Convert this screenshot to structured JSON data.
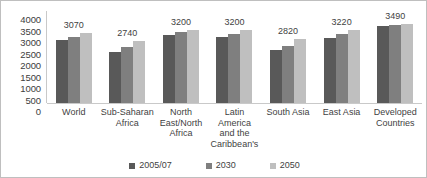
{
  "chart_data": {
    "type": "bar",
    "title": "",
    "subtitle": "",
    "xlabel": "",
    "ylabel": "",
    "ylim": [
      0,
      4000
    ],
    "ytick_step": 500,
    "yticks": [
      "4000",
      "3500",
      "3000",
      "2500",
      "2000",
      "1500",
      "1000",
      "500",
      "0"
    ],
    "grid": false,
    "legend_position": "bottom",
    "categories": [
      "World",
      "Sub-Saharan Africa",
      "North East/North Africa",
      "Latin America and the Caribbean's",
      "South Asia",
      "East Asia",
      "Developed Countries"
    ],
    "series": [
      {
        "name": "2005/07",
        "color": "#595959",
        "values": [
          2780,
          2240,
          2980,
          2900,
          2360,
          2880,
          3380
        ]
      },
      {
        "name": "2030",
        "color": "#7f7f7f",
        "values": [
          2930,
          2500,
          3110,
          3050,
          2540,
          3030,
          3440
        ]
      },
      {
        "name": "2050",
        "color": "#bfbfbf",
        "values": [
          3070,
          2740,
          3200,
          3200,
          2820,
          3220,
          3490
        ]
      }
    ],
    "data_labels": [
      "3070",
      "2740",
      "3200",
      "3200",
      "2820",
      "3220",
      "3490"
    ],
    "data_labels_note": "value of the 2050 series shown above each group"
  },
  "legend": {
    "items": [
      {
        "label": "2005/07",
        "color": "#595959"
      },
      {
        "label": "2030",
        "color": "#7f7f7f"
      },
      {
        "label": "2050",
        "color": "#bfbfbf"
      }
    ]
  },
  "category_labels": [
    "World",
    "Sub-Saharan\nAfrica",
    "North\nEast/North\nAfrica",
    "Latin America\nand the\nCaribbean's",
    "South Asia",
    "East Asia",
    "Developed\nCountries"
  ]
}
